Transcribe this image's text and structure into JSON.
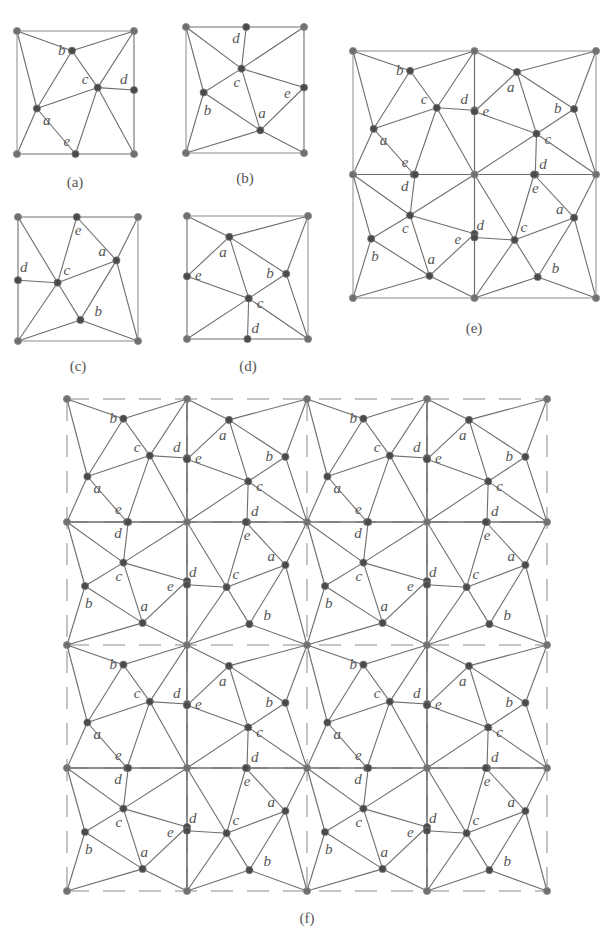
{
  "figure": {
    "colors": {
      "edge": "#6e6e6e",
      "node": "#4a4a4a",
      "label": "#555555",
      "background": "#ffffff"
    }
  },
  "patterns": {
    "a": {
      "vertices": {
        "a": [
          0.17,
          0.63
        ],
        "b": [
          0.47,
          0.16
        ],
        "c": [
          0.69,
          0.46
        ],
        "d": [
          1.0,
          0.48
        ],
        "e": [
          0.5,
          1.0
        ]
      },
      "label_offsets": {
        "a": [
          6,
          16
        ],
        "b": [
          -14,
          4
        ],
        "c": [
          -16,
          -4
        ],
        "d": [
          -14,
          -6
        ],
        "e": [
          -12,
          -8
        ]
      },
      "edges": [
        [
          "TL",
          "TR"
        ],
        [
          "TL",
          "b"
        ],
        [
          "TL",
          "a"
        ],
        [
          "TR",
          "b"
        ],
        [
          "TR",
          "c"
        ],
        [
          "b",
          "a"
        ],
        [
          "b",
          "c"
        ],
        [
          "a",
          "c"
        ],
        [
          "a",
          "BL"
        ],
        [
          "a",
          "e"
        ],
        [
          "c",
          "d"
        ],
        [
          "c",
          "e"
        ],
        [
          "c",
          "BR"
        ],
        [
          "BL",
          "e"
        ],
        [
          "e",
          "BR"
        ],
        [
          "TL",
          "BL"
        ],
        [
          "TR",
          "d"
        ],
        [
          "d",
          "BR"
        ]
      ]
    },
    "b": {
      "vertices": {
        "d": [
          0.51,
          0.0
        ],
        "c": [
          0.47,
          0.33
        ],
        "b": [
          0.15,
          0.52
        ],
        "e": [
          1.0,
          0.48
        ],
        "a": [
          0.63,
          0.82
        ]
      },
      "label_offsets": {
        "d": [
          -14,
          16
        ],
        "c": [
          -8,
          18
        ],
        "b": [
          0,
          22
        ],
        "e": [
          -20,
          10
        ],
        "a": [
          -2,
          -12
        ]
      },
      "edges": [
        [
          "TL",
          "d"
        ],
        [
          "d",
          "TR"
        ],
        [
          "TL",
          "c"
        ],
        [
          "d",
          "c"
        ],
        [
          "TR",
          "c"
        ],
        [
          "TL",
          "b"
        ],
        [
          "b",
          "c"
        ],
        [
          "c",
          "e"
        ],
        [
          "c",
          "a"
        ],
        [
          "b",
          "a"
        ],
        [
          "a",
          "e"
        ],
        [
          "b",
          "BL"
        ],
        [
          "BL",
          "a"
        ],
        [
          "a",
          "BR"
        ],
        [
          "TL",
          "BL"
        ],
        [
          "TR",
          "e"
        ],
        [
          "e",
          "BR"
        ],
        [
          "BL",
          "BR"
        ]
      ]
    },
    "c": {
      "vertices": {
        "e": [
          0.49,
          0.0
        ],
        "a": [
          0.82,
          0.35
        ],
        "d": [
          0.0,
          0.51
        ],
        "c": [
          0.33,
          0.53
        ],
        "b": [
          0.52,
          0.83
        ]
      },
      "label_offsets": {
        "e": [
          -2,
          18
        ],
        "a": [
          -18,
          -4
        ],
        "d": [
          2,
          -8
        ],
        "c": [
          6,
          -8
        ],
        "b": [
          14,
          -4
        ]
      },
      "edges": [
        [
          "TL",
          "e"
        ],
        [
          "e",
          "TR"
        ],
        [
          "TL",
          "c"
        ],
        [
          "e",
          "c"
        ],
        [
          "e",
          "a"
        ],
        [
          "TR",
          "a"
        ],
        [
          "d",
          "c"
        ],
        [
          "c",
          "a"
        ],
        [
          "c",
          "b"
        ],
        [
          "a",
          "b"
        ],
        [
          "a",
          "BR"
        ],
        [
          "c",
          "BL"
        ],
        [
          "BL",
          "b"
        ],
        [
          "b",
          "BR"
        ],
        [
          "TL",
          "d"
        ],
        [
          "d",
          "BL"
        ],
        [
          "TR",
          "BR"
        ],
        [
          "BL",
          "BR"
        ]
      ]
    },
    "d": {
      "vertices": {
        "a": [
          0.35,
          0.17
        ],
        "e": [
          0.0,
          0.49
        ],
        "b": [
          0.82,
          0.47
        ],
        "c": [
          0.51,
          0.67
        ],
        "d": [
          0.5,
          1.0
        ]
      },
      "label_offsets": {
        "a": [
          -10,
          20
        ],
        "e": [
          8,
          4
        ],
        "b": [
          -20,
          4
        ],
        "c": [
          8,
          10
        ],
        "d": [
          4,
          -6
        ]
      },
      "edges": [
        [
          "TL",
          "TR"
        ],
        [
          "TL",
          "a"
        ],
        [
          "a",
          "TR"
        ],
        [
          "a",
          "e"
        ],
        [
          "a",
          "b"
        ],
        [
          "a",
          "c"
        ],
        [
          "TR",
          "b"
        ],
        [
          "TR",
          "BR"
        ],
        [
          "e",
          "c"
        ],
        [
          "b",
          "c"
        ],
        [
          "b",
          "BR"
        ],
        [
          "c",
          "BL"
        ],
        [
          "c",
          "d"
        ],
        [
          "c",
          "BR"
        ],
        [
          "TL",
          "e"
        ],
        [
          "e",
          "BL"
        ],
        [
          "BL",
          "d"
        ],
        [
          "d",
          "BR"
        ]
      ]
    }
  },
  "panels": [
    {
      "id": "a",
      "caption": "(a)",
      "tiles": [
        [
          "a"
        ]
      ],
      "x": 17,
      "y": 31,
      "cell_w": 117,
      "cell_h": 123,
      "caption_x": 75,
      "caption_y": 187,
      "dashed": false
    },
    {
      "id": "b",
      "caption": "(b)",
      "tiles": [
        [
          "b"
        ]
      ],
      "x": 186,
      "y": 27,
      "cell_w": 118,
      "cell_h": 126,
      "caption_x": 245,
      "caption_y": 183,
      "dashed": false
    },
    {
      "id": "c",
      "caption": "(c)",
      "tiles": [
        [
          "c"
        ]
      ],
      "x": 18,
      "y": 217,
      "cell_w": 120,
      "cell_h": 124,
      "caption_x": 78,
      "caption_y": 371,
      "dashed": false
    },
    {
      "id": "d",
      "caption": "(d)",
      "tiles": [
        [
          "d"
        ]
      ],
      "x": 187,
      "y": 216,
      "cell_w": 121,
      "cell_h": 123,
      "caption_x": 248,
      "caption_y": 371,
      "dashed": false
    },
    {
      "id": "e",
      "caption": "(e)",
      "tiles": [
        [
          "a",
          "d"
        ],
        [
          "b",
          "c"
        ]
      ],
      "x": 353,
      "y": 51,
      "cell_w": 121.5,
      "cell_h": 123.5,
      "caption_x": 474,
      "caption_y": 333,
      "dashed": false
    },
    {
      "id": "f",
      "caption": "(f)",
      "tiles": [
        [
          "a",
          "d",
          "a",
          "d"
        ],
        [
          "b",
          "c",
          "b",
          "c"
        ],
        [
          "a",
          "d",
          "a",
          "d"
        ],
        [
          "b",
          "c",
          "b",
          "c"
        ]
      ],
      "x": 67,
      "y": 399,
      "cell_w": 120,
      "cell_h": 123,
      "caption_x": 307,
      "caption_y": 923,
      "dashed": true
    }
  ]
}
